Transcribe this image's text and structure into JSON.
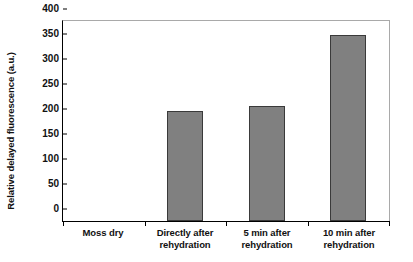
{
  "chart_data": {
    "type": "bar",
    "title": "",
    "xlabel": "",
    "ylabel": "Relative delayed fluorescence (a.u.)",
    "categories": [
      "Moss dry",
      "Directly after\nrehydration",
      "5 min after\nrehydration",
      "10 min after\nrehydration"
    ],
    "values": [
      0,
      220,
      231,
      373
    ],
    "ylim": [
      0,
      400
    ],
    "yticks": [
      0,
      50,
      100,
      150,
      200,
      250,
      300,
      350,
      400
    ],
    "ytick_labels": [
      "0",
      "50",
      "100",
      "150",
      "200",
      "250",
      "300",
      "350",
      "400"
    ],
    "grid": false,
    "legend": null,
    "bar_color": "#808080",
    "bar_edge_color": "#3a3a3a",
    "axis_color": "#000000",
    "frame_color": "#a9a9a9",
    "background_color": "#ffffff"
  }
}
